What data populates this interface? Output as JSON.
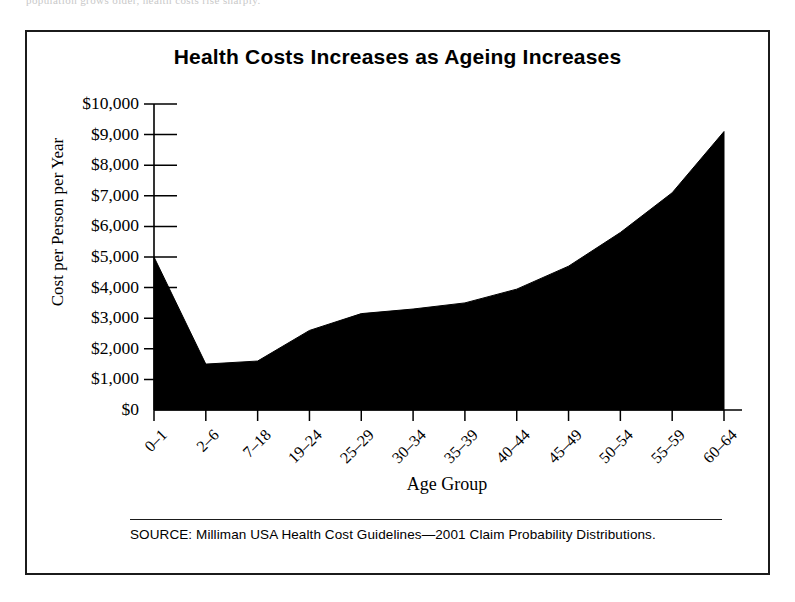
{
  "figure": {
    "title": "Health Costs Increases as Ageing Increases",
    "source_note": "SOURCE: Milliman USA Health Cost Guidelines—2001 Claim Probability Distributions.",
    "scan_artifact_text": "population grows older, health costs rise sharply.",
    "frame_color": "#1b1b1b",
    "fill_color": "#000000",
    "background_color": "#ffffff"
  },
  "chart_data": {
    "type": "area",
    "title": "Health Costs Increases as Ageing Increases",
    "xlabel": "Age Group",
    "ylabel": "Cost per Person per Year",
    "categories": [
      "0–1",
      "2–6",
      "7–18",
      "19–24",
      "25–29",
      "30–34",
      "35–39",
      "40–44",
      "45–49",
      "50–54",
      "55–59",
      "60–64"
    ],
    "values": [
      5000,
      1500,
      1600,
      2600,
      3150,
      3300,
      3500,
      3950,
      4700,
      5800,
      7100,
      9100
    ],
    "ylim": [
      0,
      10000
    ],
    "ytick_values": [
      0,
      1000,
      2000,
      3000,
      4000,
      5000,
      6000,
      7000,
      8000,
      9000,
      10000
    ],
    "ytick_labels": [
      "$0",
      "$1,000",
      "$2,000",
      "$3,000",
      "$4,000",
      "$5,000",
      "$6,000",
      "$7,000",
      "$8,000",
      "$9,000",
      "$10,000"
    ],
    "grid": false,
    "legend": "none",
    "series_name": "Cost per Person per Year"
  }
}
